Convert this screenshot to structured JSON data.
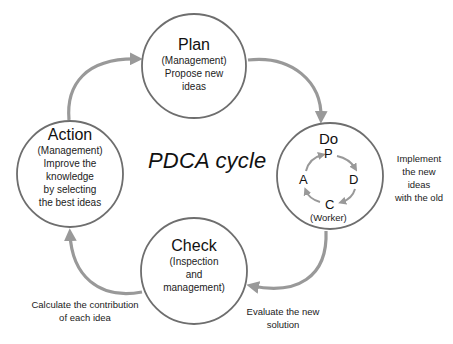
{
  "diagram": {
    "title": "PDCA cycle",
    "colors": {
      "circle_stroke": "#6e6e6e",
      "arrow": "#999999",
      "text": "#1a1a1a"
    },
    "nodes": {
      "plan": {
        "title": "Plan",
        "lines": [
          "(Management)",
          "Propose new",
          "ideas"
        ]
      },
      "do": {
        "title": "Do",
        "mini_cycle": {
          "p": "P",
          "d": "D",
          "c": "C",
          "a": "A"
        },
        "role": "(Worker)"
      },
      "check": {
        "title": "Check",
        "lines": [
          "(Inspection",
          "and",
          "management)"
        ]
      },
      "action": {
        "title": "Action",
        "lines": [
          "(Management)",
          "Improve the",
          "knowledge",
          "by selecting",
          "the best ideas"
        ]
      }
    },
    "annotations": {
      "do": [
        "Implement",
        "the new",
        "ideas",
        "with the old"
      ],
      "check": [
        "Evaluate the new",
        "solution"
      ],
      "action": [
        "Calculate the contribution",
        "of each idea"
      ]
    },
    "edges": [
      {
        "from": "Action",
        "to": "Plan"
      },
      {
        "from": "Plan",
        "to": "Do"
      },
      {
        "from": "Do",
        "to": "Check"
      },
      {
        "from": "Check",
        "to": "Action"
      }
    ]
  }
}
